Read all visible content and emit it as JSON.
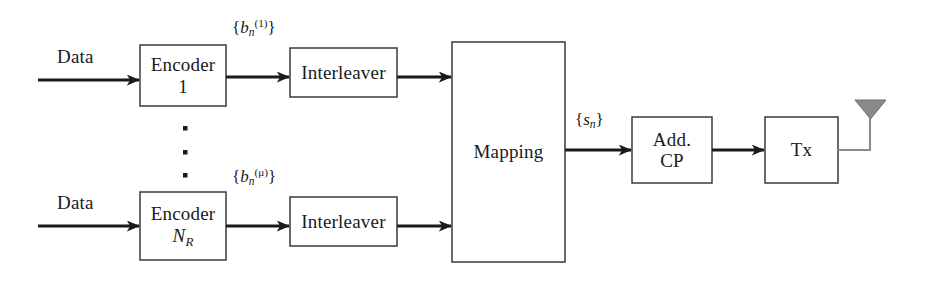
{
  "diagram": {
    "background_color": "#ffffff",
    "line_color": "#1a1a1a",
    "box_stroke_color": "#3a3a3a",
    "antenna_color": "#8a8a8a",
    "blocks": [
      {
        "id": "encoder_1",
        "line1": "Encoder",
        "line2": "1",
        "x": 140,
        "y": 45,
        "w": 86,
        "h": 61
      },
      {
        "id": "interleaver_1",
        "line1": "Interleaver",
        "line2": "",
        "x": 290,
        "y": 48,
        "w": 107,
        "h": 49
      },
      {
        "id": "encoder_nr",
        "line1": "Encoder",
        "line2": "NR",
        "x": 140,
        "y": 192,
        "w": 86,
        "h": 68
      },
      {
        "id": "interleaver_nr",
        "line1": "Interleaver",
        "line2": "",
        "x": 290,
        "y": 197,
        "w": 107,
        "h": 49
      },
      {
        "id": "mapping",
        "line1": "Mapping",
        "line2": "",
        "x": 452,
        "y": 42,
        "w": 113,
        "h": 220
      },
      {
        "id": "add_cp",
        "line1": "Add.",
        "line2": "CP",
        "x": 632,
        "y": 117,
        "w": 80,
        "h": 66
      },
      {
        "id": "tx",
        "line1": "Tx",
        "line2": "",
        "x": 765,
        "y": 117,
        "w": 73,
        "h": 66
      }
    ],
    "labels": {
      "data_top": "Data",
      "data_bottom": "Data",
      "bits_top": "{b_n^(1)}",
      "bits_bottom": "{b_n^(μ)}",
      "symbols": "{s_n}",
      "encoder_index_top": "1",
      "encoder_index_bottom": "N_R",
      "vertical_ellipsis": "⋮"
    },
    "signals": {
      "bits_top_base": "b",
      "bits_top_sub": "n",
      "bits_top_sup": "(1)",
      "bits_bottom_base": "b",
      "bits_bottom_sub": "n",
      "bits_bottom_sup": "(μ)",
      "symbols_base": "s",
      "symbols_sub": "n"
    },
    "antenna": {
      "name": "transmit-antenna",
      "color": "#8a8a8a"
    }
  }
}
